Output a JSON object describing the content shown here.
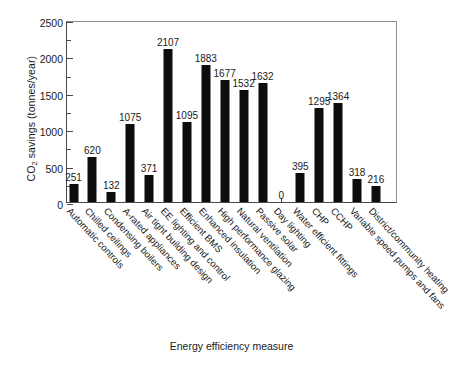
{
  "chart_data": {
    "type": "bar",
    "title": "",
    "xlabel": "Energy efficiency measure",
    "ylabel": "CO2 savings (tonnes/year)",
    "ylabel_prefix": "CO",
    "ylabel_sub": "2",
    "ylabel_suffix": " savings (tonnes/year)",
    "ylim": [
      0,
      2500
    ],
    "yticks": [
      0,
      500,
      1000,
      1500,
      2000,
      2500
    ],
    "ytick_labels": [
      "0",
      "500",
      "1000",
      "1500",
      "2000",
      "2500"
    ],
    "grid": false,
    "legend": "none",
    "categories": [
      "Automatic controls",
      "Chilled ceilings",
      "Condensing boilers",
      "A-rated appliances",
      "Air tight building design",
      "EE lighting and control",
      "Efficient BMS",
      "Enhanced insulation",
      "High performance glazing",
      "Natural ventilation",
      "Passive solar",
      "Day lighting",
      "Water efficient fittings",
      "CHP",
      "CCHP",
      "Variable speed pumps and fans",
      "District/community heating"
    ],
    "values": [
      251,
      620,
      132,
      1075,
      371,
      2107,
      1095,
      1883,
      1677,
      1532,
      1632,
      0,
      395,
      1295,
      1364,
      318,
      216
    ],
    "value_labels": [
      "251",
      "620",
      "132",
      "1075",
      "371",
      "2107",
      "1095",
      "1883",
      "1677",
      "1532",
      "1632",
      "0",
      "395",
      "1295",
      "1364",
      "318",
      "216"
    ],
    "bar_color": "#0d0d0d",
    "axis_color": "#4a4a4a",
    "background": "#ffffff"
  }
}
